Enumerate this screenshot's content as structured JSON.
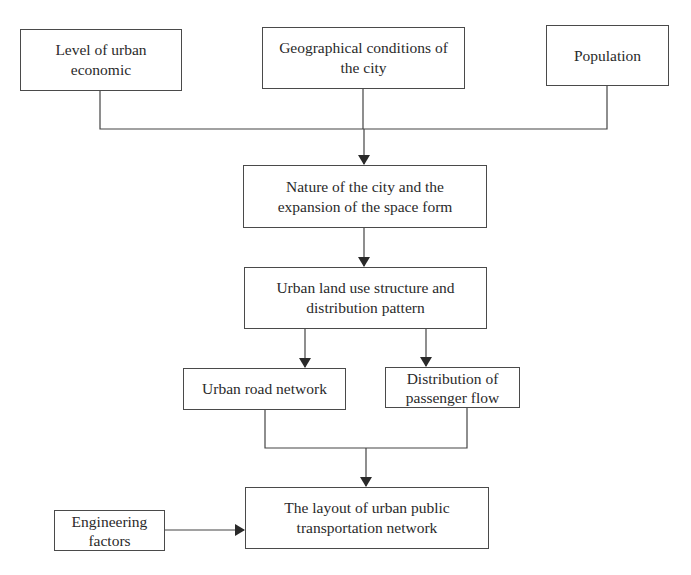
{
  "diagram": {
    "type": "flowchart",
    "nodes": [
      {
        "id": "economic",
        "label": "Level of urban economic"
      },
      {
        "id": "geo",
        "label": "Geographical conditions of the city"
      },
      {
        "id": "population",
        "label": "Population"
      },
      {
        "id": "nature",
        "label": "Nature of the city and the expansion of the space form"
      },
      {
        "id": "landuse",
        "label": "Urban land use structure and distribution pattern"
      },
      {
        "id": "road",
        "label": "Urban road network"
      },
      {
        "id": "flow",
        "label": "Distribution of passenger flow"
      },
      {
        "id": "layout",
        "label": "The layout of urban public transportation network"
      },
      {
        "id": "engineering",
        "label": "Engineering factors"
      }
    ],
    "edges": [
      {
        "from": [
          "economic",
          "geo",
          "population"
        ],
        "to": "nature"
      },
      {
        "from": "nature",
        "to": "landuse"
      },
      {
        "from": "landuse",
        "to": "road"
      },
      {
        "from": "landuse",
        "to": "flow"
      },
      {
        "from": [
          "road",
          "flow"
        ],
        "to": "layout"
      },
      {
        "from": "engineering",
        "to": "layout"
      }
    ],
    "colors": {
      "line": "#3a3a3a",
      "text": "#2a2a2a",
      "background": "#ffffff"
    }
  }
}
